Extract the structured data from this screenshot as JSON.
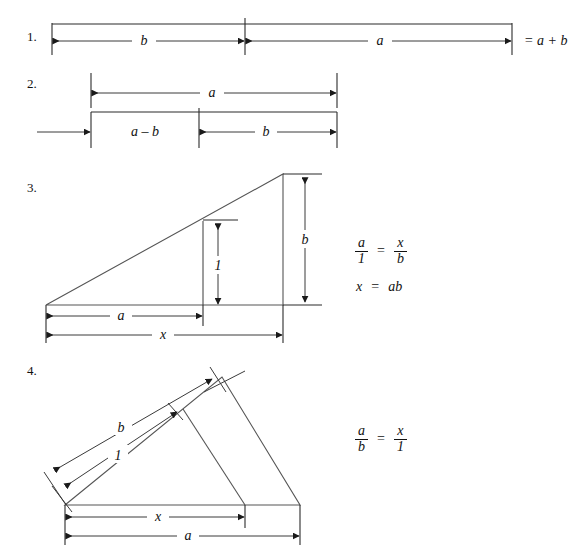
{
  "document": {
    "title": "Geometric constructions for multiplication",
    "background_color": "#ffffff",
    "ink_color": "#2b2b2b"
  },
  "steps": [
    {
      "number": "1.",
      "name": "addition-segment",
      "labels": {
        "left_segment": "b",
        "right_segment": "a"
      },
      "result": "= a + b"
    },
    {
      "number": "2.",
      "name": "subtraction-segment",
      "labels": {
        "total": "a",
        "left_part": "a – b",
        "right_part": "b"
      }
    },
    {
      "number": "3.",
      "name": "multiplication-triangle",
      "labels": {
        "height_right": "b",
        "height_inner": "1",
        "base_inner": "a",
        "base_outer": "x"
      },
      "equations": {
        "proportion": {
          "left_num": "a",
          "left_den": "1",
          "rel": "=",
          "right_num": "x",
          "right_den": "b"
        },
        "result": {
          "lhs": "x",
          "rel": "=",
          "rhs": "ab"
        }
      }
    },
    {
      "number": "4.",
      "name": "division-triangle",
      "labels": {
        "upper_slant": "b",
        "lower_slant": "1",
        "base_inner": "x",
        "base_outer": "a"
      },
      "equations": {
        "proportion": {
          "left_num": "a",
          "left_den": "b",
          "rel": "=",
          "right_num": "x",
          "right_den": "1"
        }
      }
    }
  ]
}
